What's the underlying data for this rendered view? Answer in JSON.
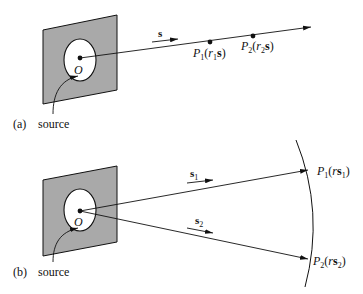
{
  "panels": [
    {
      "id": "a",
      "tag": "(a)",
      "source_label": "source",
      "origin_label": "O",
      "direction_label": "s",
      "points": [
        {
          "name": "P",
          "sub": "1",
          "open": "(",
          "r": "r",
          "rsub": "1",
          "vec": "s",
          "close": ")"
        },
        {
          "name": "P",
          "sub": "2",
          "open": "(",
          "r": "r",
          "rsub": "2",
          "vec": "s",
          "close": ")"
        }
      ]
    },
    {
      "id": "b",
      "tag": "(b)",
      "source_label": "source",
      "origin_label": "O",
      "directions": [
        {
          "vec": "s",
          "sub": "1"
        },
        {
          "vec": "s",
          "sub": "2"
        }
      ],
      "points": [
        {
          "name": "P",
          "sub": "1",
          "open": "(",
          "r": "r",
          "vec": "s",
          "vsub": "1",
          "close": ")"
        },
        {
          "name": "P",
          "sub": "2",
          "open": "(",
          "r": "r",
          "vec": "s",
          "vsub": "2",
          "close": ")"
        }
      ]
    }
  ],
  "colors": {
    "screen_fill": "#a9a9a9",
    "stroke": "#111111",
    "aperture_fill": "#ffffff"
  }
}
